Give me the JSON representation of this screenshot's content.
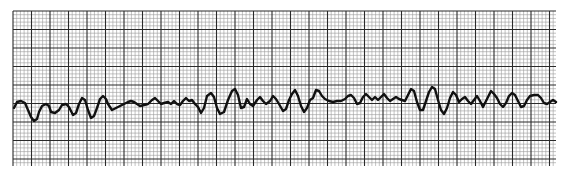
{
  "chart_data": {
    "type": "line",
    "title": "",
    "xlabel": "",
    "ylabel": "",
    "grid": {
      "on": true,
      "area": {
        "x0": 13,
        "y0": 11,
        "x1": 556,
        "y1": 166
      },
      "minor_spacing_px": 3.7,
      "major_every": 5,
      "minor_color": "#9a9a9a",
      "major_color": "#2a2a2a"
    },
    "trace_color": "#111111",
    "trace_width": 2.4,
    "series": [
      {
        "name": "ECG trace",
        "points": [
          [
            14,
            108
          ],
          [
            17,
            102
          ],
          [
            21,
            101
          ],
          [
            25,
            103
          ],
          [
            28,
            110
          ],
          [
            31,
            117
          ],
          [
            34,
            121
          ],
          [
            37,
            119
          ],
          [
            39,
            112
          ],
          [
            42,
            106
          ],
          [
            46,
            104
          ],
          [
            49,
            106
          ],
          [
            51,
            112
          ],
          [
            55,
            113
          ],
          [
            59,
            110
          ],
          [
            62,
            105
          ],
          [
            66,
            104
          ],
          [
            69,
            107
          ],
          [
            73,
            115
          ],
          [
            76,
            113
          ],
          [
            79,
            104
          ],
          [
            82,
            98
          ],
          [
            85,
            100
          ],
          [
            88,
            110
          ],
          [
            91,
            118
          ],
          [
            94,
            116
          ],
          [
            97,
            108
          ],
          [
            100,
            99
          ],
          [
            103,
            96
          ],
          [
            106,
            99
          ],
          [
            108,
            104
          ],
          [
            112,
            110
          ],
          [
            116,
            108
          ],
          [
            120,
            106
          ],
          [
            124,
            104
          ],
          [
            128,
            102
          ],
          [
            131,
            101
          ],
          [
            134,
            102
          ],
          [
            137,
            104
          ],
          [
            140,
            106
          ],
          [
            144,
            105
          ],
          [
            148,
            104
          ],
          [
            152,
            100
          ],
          [
            155,
            98
          ],
          [
            158,
            101
          ],
          [
            161,
            104
          ],
          [
            164,
            103
          ],
          [
            168,
            102
          ],
          [
            171,
            104
          ],
          [
            174,
            101
          ],
          [
            177,
            104
          ],
          [
            180,
            105
          ],
          [
            183,
            101
          ],
          [
            186,
            98
          ],
          [
            189,
            101
          ],
          [
            192,
            100
          ],
          [
            195,
            104
          ],
          [
            198,
            107
          ],
          [
            201,
            113
          ],
          [
            204,
            108
          ],
          [
            207,
            96
          ],
          [
            211,
            93
          ],
          [
            214,
            97
          ],
          [
            217,
            108
          ],
          [
            220,
            114
          ],
          [
            224,
            112
          ],
          [
            228,
            100
          ],
          [
            232,
            91
          ],
          [
            235,
            89
          ],
          [
            238,
            95
          ],
          [
            241,
            108
          ],
          [
            244,
            107
          ],
          [
            247,
            99
          ],
          [
            250,
            104
          ],
          [
            253,
            106
          ],
          [
            257,
            100
          ],
          [
            260,
            97
          ],
          [
            263,
            101
          ],
          [
            266,
            104
          ],
          [
            270,
            101
          ],
          [
            273,
            96
          ],
          [
            276,
            99
          ],
          [
            279,
            104
          ],
          [
            283,
            111
          ],
          [
            286,
            109
          ],
          [
            289,
            100
          ],
          [
            292,
            94
          ],
          [
            295,
            90
          ],
          [
            298,
            96
          ],
          [
            301,
            106
          ],
          [
            304,
            112
          ],
          [
            307,
            108
          ],
          [
            310,
            100
          ],
          [
            313,
            98
          ],
          [
            316,
            90
          ],
          [
            319,
            91
          ],
          [
            322,
            96
          ],
          [
            325,
            99
          ],
          [
            329,
            101
          ],
          [
            333,
            102
          ],
          [
            337,
            101
          ],
          [
            341,
            101
          ],
          [
            345,
            99
          ],
          [
            348,
            96
          ],
          [
            351,
            95
          ],
          [
            354,
            98
          ],
          [
            357,
            104
          ],
          [
            360,
            103
          ],
          [
            363,
            97
          ],
          [
            366,
            94
          ],
          [
            369,
            97
          ],
          [
            372,
            100
          ],
          [
            375,
            97
          ],
          [
            378,
            100
          ],
          [
            381,
            97
          ],
          [
            384,
            94
          ],
          [
            387,
            98
          ],
          [
            390,
            101
          ],
          [
            393,
            99
          ],
          [
            396,
            97
          ],
          [
            399,
            99
          ],
          [
            402,
            100
          ],
          [
            405,
            101
          ],
          [
            408,
            95
          ],
          [
            411,
            89
          ],
          [
            414,
            91
          ],
          [
            417,
            102
          ],
          [
            420,
            110
          ],
          [
            423,
            110
          ],
          [
            426,
            101
          ],
          [
            429,
            92
          ],
          [
            432,
            87
          ],
          [
            435,
            89
          ],
          [
            438,
            100
          ],
          [
            441,
            110
          ],
          [
            444,
            114
          ],
          [
            447,
            108
          ],
          [
            450,
            98
          ],
          [
            453,
            92
          ],
          [
            456,
            95
          ],
          [
            459,
            102
          ],
          [
            462,
            99
          ],
          [
            465,
            97
          ],
          [
            468,
            101
          ],
          [
            471,
            104
          ],
          [
            474,
            100
          ],
          [
            477,
            96
          ],
          [
            480,
            101
          ],
          [
            483,
            107
          ],
          [
            486,
            101
          ],
          [
            489,
            95
          ],
          [
            491,
            91
          ],
          [
            494,
            94
          ],
          [
            497,
            98
          ],
          [
            500,
            104
          ],
          [
            503,
            107
          ],
          [
            506,
            103
          ],
          [
            509,
            96
          ],
          [
            512,
            93
          ],
          [
            515,
            95
          ],
          [
            518,
            101
          ],
          [
            521,
            107
          ],
          [
            524,
            106
          ],
          [
            527,
            100
          ],
          [
            530,
            96
          ],
          [
            534,
            95
          ],
          [
            538,
            95
          ],
          [
            541,
            98
          ],
          [
            544,
            103
          ],
          [
            547,
            104
          ],
          [
            550,
            102
          ],
          [
            553,
            100
          ],
          [
            556,
            102
          ]
        ]
      }
    ],
    "xlim": [
      13,
      556
    ],
    "ylim": [
      11,
      166
    ],
    "legend": null
  }
}
